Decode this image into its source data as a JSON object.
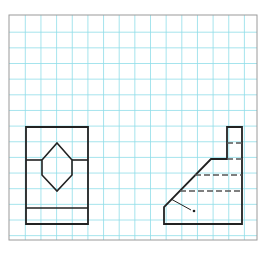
{
  "diagram": {
    "type": "orthographic-views-on-grid-paper",
    "colors": {
      "background": "#ffffff",
      "grid": "#8fdde8",
      "border": "#9a9a9a",
      "lines": "#222222",
      "hidden_lines": "#555555"
    },
    "grid": {
      "x_left": 9,
      "y_top": 15,
      "x_right": 257,
      "y_bottom": 240,
      "first_x": 25.3,
      "first_y": 32.2,
      "step": 15.65
    },
    "views": [
      {
        "name": "front-view",
        "outline": [
          [
            26,
            127
          ],
          [
            88,
            127
          ],
          [
            88,
            224
          ],
          [
            26,
            224
          ]
        ],
        "horizontal_lines": [
          {
            "x1": 26,
            "x2": 42,
            "y": 160
          },
          {
            "x1": 72,
            "x2": 88,
            "y": 160
          },
          {
            "x1": 26,
            "x2": 88,
            "y": 208
          }
        ],
        "hexagon": [
          [
            57,
            143
          ],
          [
            72,
            160
          ],
          [
            72,
            175
          ],
          [
            57,
            191
          ],
          [
            42,
            175
          ],
          [
            42,
            160
          ]
        ]
      },
      {
        "name": "side-view",
        "outline": [
          [
            227,
            127
          ],
          [
            242,
            127
          ],
          [
            242,
            224
          ],
          [
            164,
            224
          ],
          [
            164,
            207
          ],
          [
            211,
            159
          ],
          [
            227,
            159
          ]
        ],
        "hidden_lines": [
          {
            "x1": 227,
            "x2": 242,
            "y": 143
          },
          {
            "x1": 227,
            "x2": 242,
            "y": 159
          },
          {
            "x1": 195,
            "x2": 242,
            "y": 175
          },
          {
            "x1": 180,
            "x2": 242,
            "y": 191
          }
        ],
        "leader": {
          "x1": 171,
          "y1": 199,
          "x2": 191,
          "y2": 210,
          "point_x": 194,
          "point_y": 211
        }
      }
    ]
  }
}
